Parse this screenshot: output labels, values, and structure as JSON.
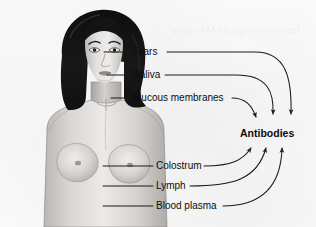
{
  "figure": {
    "title": "Antibodies",
    "watermark_text": "Immunological Memory",
    "colors": {
      "background": "#fdfdfd",
      "line": "#1a1a1a",
      "text": "#0d0d0d",
      "hair": "#151515",
      "skin_light": "#e6e4e2",
      "skin_mid": "#c9c6c3",
      "skin_shadow": "#a7a4a1"
    }
  },
  "target": {
    "label": "Antibodies",
    "x": 272,
    "y": 134
  },
  "labels": [
    {
      "id": "tears",
      "text": "Tears",
      "x": 133,
      "y": 46,
      "leader_from_x": 104,
      "leader_y": 52
    },
    {
      "id": "saliva",
      "text": "Saliva",
      "x": 133,
      "y": 69,
      "leader_from_x": 107,
      "leader_y": 75
    },
    {
      "id": "mucous-membranes",
      "text": "Mucous membranes",
      "x": 133,
      "y": 92,
      "leader_from_x": 111,
      "leader_y": 98
    },
    {
      "id": "colostrum",
      "text": "Colostrum",
      "x": 156,
      "y": 160,
      "leader_from_x": 103,
      "leader_y": 166
    },
    {
      "id": "lymph",
      "text": "Lymph",
      "x": 156,
      "y": 180,
      "leader_from_x": 103,
      "leader_y": 186
    },
    {
      "id": "blood-plasma",
      "text": "Blood plasma",
      "x": 156,
      "y": 200,
      "leader_from_x": 103,
      "leader_y": 206
    }
  ],
  "arrows": [
    {
      "id": "arrow-tears",
      "from": "tears",
      "direction": "down-right"
    },
    {
      "id": "arrow-saliva",
      "from": "saliva",
      "direction": "down-right"
    },
    {
      "id": "arrow-mucous-membranes",
      "from": "mucous-membranes",
      "direction": "down-right"
    },
    {
      "id": "arrow-colostrum",
      "from": "colostrum",
      "direction": "up-right"
    },
    {
      "id": "arrow-lymph",
      "from": "lymph",
      "direction": "up-right"
    },
    {
      "id": "arrow-blood-plasma",
      "from": "blood-plasma",
      "direction": "up-right"
    }
  ]
}
